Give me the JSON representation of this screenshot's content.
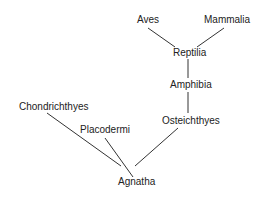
{
  "diagram": {
    "type": "phylogenetic-tree",
    "nodes": {
      "aves": "Aves",
      "mammalia": "Mammalia",
      "reptilia": "Reptilia",
      "amphibia": "Amphibia",
      "osteichthyes": "Osteichthyes",
      "chondrichthyes": "Chondrichthyes",
      "placodermi": "Placodermi",
      "agnatha": "Agnatha"
    },
    "edges": [
      [
        "Aves",
        "Reptilia"
      ],
      [
        "Mammalia",
        "Reptilia"
      ],
      [
        "Reptilia",
        "Amphibia"
      ],
      [
        "Amphibia",
        "Osteichthyes"
      ],
      [
        "Osteichthyes",
        "Agnatha"
      ],
      [
        "Placodermi",
        "Agnatha"
      ],
      [
        "Chondrichthyes",
        "Agnatha"
      ]
    ],
    "line_color": "#333333"
  }
}
